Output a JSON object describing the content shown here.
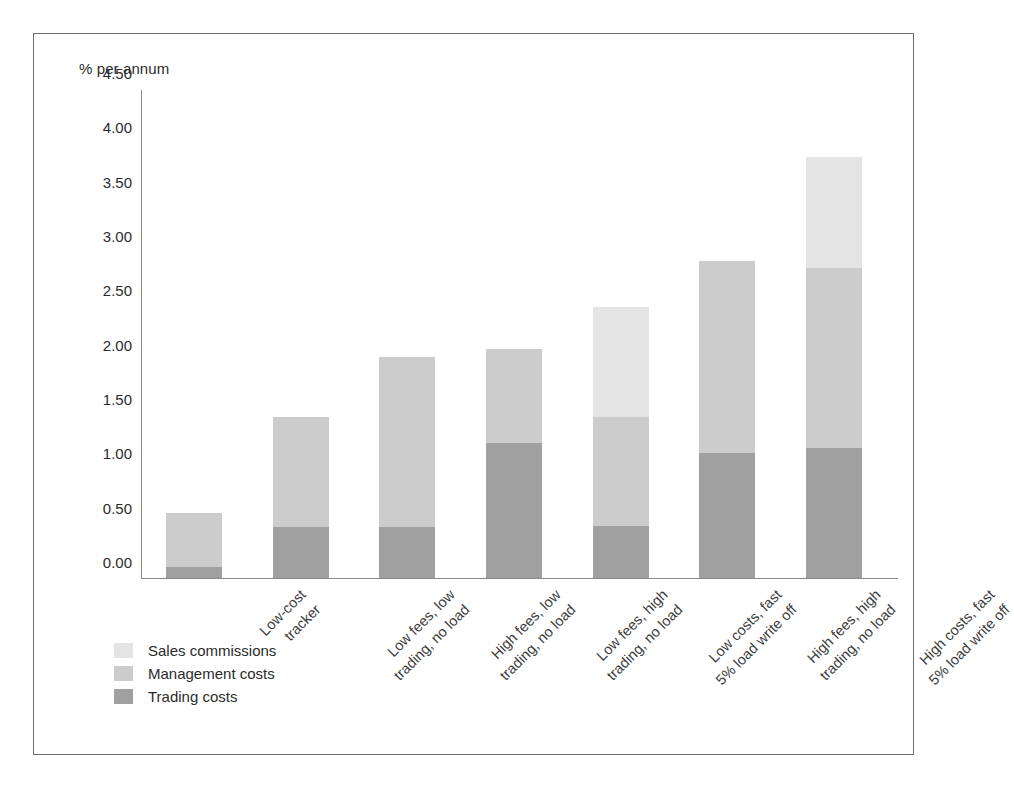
{
  "chart_data": {
    "type": "bar",
    "stacked": true,
    "title": "",
    "xlabel": "",
    "ylabel": "% per annum",
    "ylim": [
      0.0,
      4.5
    ],
    "ytick_labels": [
      "4.50",
      "4.00",
      "3.50",
      "3.00",
      "2.50",
      "2.00",
      "1.50",
      "1.00",
      "0.50",
      "0.00"
    ],
    "ytick_values": [
      4.5,
      4.0,
      3.5,
      3.0,
      2.5,
      2.0,
      1.5,
      1.0,
      0.5,
      0.0
    ],
    "grid": false,
    "legend_position": "bottom-left",
    "categories": [
      "Low-cost\ntracker",
      "Low fees, low\ntrading, no load",
      "High fees, low\ntrading, no load",
      "Low fees, high\ntrading, no load",
      "Low costs, fast\n5% load write off",
      "High fees, high\ntrading, no load",
      "High costs, fast\n5% load write off"
    ],
    "category_lines": [
      [
        "Low-cost",
        "tracker"
      ],
      [
        "Low fees, low",
        "trading, no load"
      ],
      [
        "High fees, low",
        "trading, no load"
      ],
      [
        "Low fees, high",
        "trading, no load"
      ],
      [
        "Low costs, fast",
        "5% load write off"
      ],
      [
        "High fees, high",
        "trading, no load"
      ],
      [
        "High costs, fast",
        "5% load write off"
      ]
    ],
    "series": [
      {
        "name": "Sales commissions",
        "color": "#e4e4e4",
        "values": [
          0.0,
          0.0,
          0.0,
          0.0,
          1.01,
          0.0,
          1.02
        ]
      },
      {
        "name": "Management costs",
        "color": "#cccccc",
        "values": [
          0.5,
          1.01,
          1.56,
          0.87,
          1.0,
          1.77,
          1.65
        ]
      },
      {
        "name": "Trading costs",
        "color": "#a0a0a0",
        "values": [
          0.1,
          0.47,
          0.47,
          1.24,
          0.48,
          1.15,
          1.2
        ]
      }
    ],
    "totals": [
      0.6,
      1.48,
      2.03,
      2.11,
      2.49,
      2.92,
      3.87
    ]
  },
  "axis": {
    "y_title": "% per annum"
  },
  "legend": {
    "items": [
      {
        "label": "Sales commissions",
        "color": "#e4e4e4"
      },
      {
        "label": "Management costs",
        "color": "#cccccc"
      },
      {
        "label": "Trading costs",
        "color": "#a0a0a0"
      }
    ]
  }
}
